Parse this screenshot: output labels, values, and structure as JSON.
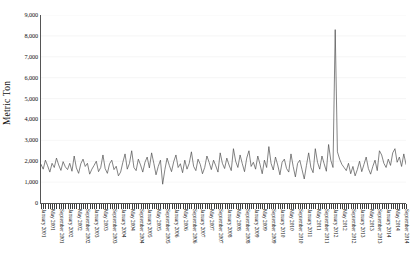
{
  "chart_data": {
    "type": "line",
    "title": "",
    "xlabel": "",
    "ylabel": "Metric Ton",
    "ylim": [
      0,
      9000
    ],
    "ytick_labels": [
      "0",
      "1,000",
      "2,000",
      "3,000",
      "4,000",
      "5,000",
      "6,000",
      "7,000",
      "8,000",
      "9,000"
    ],
    "ytick_values": [
      0,
      1000,
      2000,
      3000,
      4000,
      5000,
      6000,
      7000,
      8000,
      9000
    ],
    "grid": "faint-horizontal",
    "legend": "none",
    "line_color": "#4d4d4d",
    "series_name": "Monthly volume",
    "x_labels_visible": [
      "January 2001",
      "May 2001",
      "September 2001",
      "January 2002",
      "May 2002",
      "September 2002",
      "January 2003",
      "May 2003",
      "September 2003",
      "January 2004",
      "May 2004",
      "September 2004",
      "January 2005",
      "May 2005",
      "September 2005",
      "January 2006",
      "May 2006",
      "September 2006",
      "January 2007",
      "May 2007",
      "September 2007",
      "January 2008",
      "May 2008",
      "September 2008",
      "January 2009",
      "May 2009",
      "September 2009",
      "January 2010",
      "May 2010",
      "September 2010",
      "January 2011",
      "May 2011",
      "September 2011",
      "January 2012",
      "May 2012",
      "September 2012",
      "January 2013",
      "May 2013",
      "September 2013",
      "January 2014",
      "May 2014",
      "September 2014"
    ],
    "x_label_interval_months": 4,
    "x_start": "January 2001",
    "x_end": "October 2014",
    "n_points": 166,
    "annotations": [
      {
        "text": "peak spike",
        "x": "February 2011",
        "y": 8300
      }
    ],
    "values": [
      1850,
      1620,
      2050,
      1780,
      1480,
      1900,
      1700,
      2150,
      1820,
      1560,
      1980,
      1730,
      1600,
      1900,
      1520,
      2250,
      1680,
      1420,
      1880,
      2100,
      1750,
      1900,
      1380,
      1620,
      1800,
      2000,
      1500,
      1700,
      2300,
      1650,
      1420,
      1880,
      2050,
      1600,
      1760,
      1300,
      1480,
      1950,
      2350,
      1620,
      1900,
      2500,
      1700,
      1550,
      2100,
      1820,
      1480,
      1950,
      2200,
      1680,
      2400,
      1900,
      1350,
      1750,
      2050,
      900,
      1600,
      2150,
      1800,
      1500,
      1980,
      2300,
      1700,
      1880,
      1450,
      2050,
      1620,
      1900,
      2450,
      1750,
      1550,
      2100,
      1850,
      1400,
      1700,
      2250,
      1950,
      1600,
      2050,
      1780,
      1480,
      2400,
      1900,
      1650,
      2150,
      1820,
      1550,
      2600,
      2000,
      1700,
      2300,
      1880,
      1500,
      2150,
      2500,
      1750,
      1950,
      1620,
      2250,
      1850,
      1400,
      2050,
      1700,
      2700,
      1900,
      1580,
      2200,
      1820,
      1350,
      1950,
      2100,
      1650,
      1480,
      2350,
      1750,
      1250,
      1900,
      2050,
      1600,
      1150,
      1800,
      2400,
      1700,
      1450,
      2600,
      1950,
      1620,
      2250,
      1880,
      1520,
      2800,
      2050,
      1700,
      8300,
      2450,
      2100,
      1850,
      1700,
      1550,
      1900,
      1400,
      1750,
      1300,
      1600,
      2000,
      1500,
      1850,
      2200,
      1650,
      1380,
      1750,
      2050,
      1550,
      2500,
      2300,
      1900,
      1700,
      2100,
      1800,
      2400,
      2600,
      1950,
      2200,
      1750,
      2350,
      1850
    ]
  }
}
